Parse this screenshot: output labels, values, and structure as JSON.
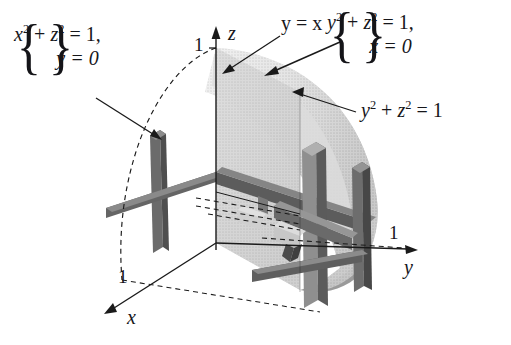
{
  "figure": {
    "kind": "3d-solid-diagram",
    "background": "#ffffff",
    "ink": "#16161a"
  },
  "axes": {
    "z": {
      "label": "z",
      "tick": "1"
    },
    "y": {
      "label": "y",
      "tick": "1"
    },
    "x": {
      "label": "x",
      "tick": "1"
    }
  },
  "annotations": {
    "left_system": {
      "line1_pre": "x",
      "line1_sup": "2",
      "line1_mid": " + ",
      "line1_z": "z",
      "line1_zsup": "2",
      "line1_eq": " = 1,",
      "line2": "y = 0",
      "brace_open": "{",
      "brace_close": "}"
    },
    "right_system": {
      "line1_pre": "y",
      "line1_sup": "2",
      "line1_mid": " + ",
      "line1_z": "z",
      "line1_zsup": "2",
      "line1_eq": " = 1,",
      "line2": "x = 0",
      "brace_open": "{",
      "brace_close": "}"
    },
    "plane_label": "y = x",
    "cylinder_label_pre": "y",
    "cylinder_label_sup": "2",
    "cylinder_label_mid": " + ",
    "cylinder_label_z": "z",
    "cylinder_label_zsup": "2",
    "cylinder_label_eq": " = 1"
  },
  "colors": {
    "surface_light": "#dedede",
    "surface_mid": "#c4c4c4",
    "surface_dark": "#a9a9a9",
    "slab_dark": "#5e5e5e",
    "slab_darker": "#4a4a4a",
    "slab_mid": "#8e8e8e",
    "slab_light": "#b5b5b5",
    "line": "#1a1a1a"
  }
}
